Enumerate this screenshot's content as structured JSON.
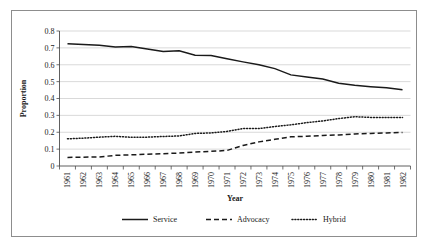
{
  "chart_data": {
    "type": "line",
    "title": "",
    "xlabel": "Year",
    "ylabel": "Proportion",
    "grid": true,
    "legend_position": "bottom",
    "ylim": [
      0,
      0.8
    ],
    "ytick_labels": [
      "0.8",
      "0.7",
      "0.6",
      "0.5",
      "0.4",
      "0.3",
      "0.2",
      "0.1",
      "0"
    ],
    "ytick_values": [
      0.8,
      0.7,
      0.6,
      0.5,
      0.4,
      0.3,
      0.2,
      0.1,
      0
    ],
    "categories": [
      "1961",
      "1962",
      "1963",
      "1964",
      "1965",
      "1966",
      "1967",
      "1968",
      "1969",
      "1970",
      "1971",
      "1972",
      "1973",
      "1974",
      "1975",
      "1976",
      "1977",
      "1978",
      "1979",
      "1980",
      "1981",
      "1982"
    ],
    "x": [
      1961,
      1962,
      1963,
      1964,
      1965,
      1966,
      1967,
      1968,
      1969,
      1970,
      1971,
      1972,
      1973,
      1974,
      1975,
      1976,
      1977,
      1978,
      1979,
      1980,
      1981,
      1982
    ],
    "series": [
      {
        "name": "Service",
        "style": "solid",
        "color": "#1a1a1a",
        "values": [
          0.725,
          0.72,
          0.715,
          0.705,
          0.708,
          0.693,
          0.679,
          0.683,
          0.657,
          0.655,
          0.635,
          0.617,
          0.6,
          0.577,
          0.54,
          0.527,
          0.515,
          0.491,
          0.478,
          0.47,
          0.463,
          0.452
        ]
      },
      {
        "name": "Advocacy",
        "style": "dashed",
        "color": "#1a1a1a",
        "values": [
          0.051,
          0.052,
          0.054,
          0.063,
          0.066,
          0.07,
          0.073,
          0.077,
          0.083,
          0.087,
          0.092,
          0.122,
          0.143,
          0.158,
          0.173,
          0.176,
          0.181,
          0.184,
          0.19,
          0.193,
          0.196,
          0.199
        ]
      },
      {
        "name": "Hybrid",
        "style": "dotted",
        "color": "#1a1a1a",
        "values": [
          0.161,
          0.165,
          0.171,
          0.176,
          0.17,
          0.171,
          0.175,
          0.178,
          0.193,
          0.196,
          0.205,
          0.222,
          0.222,
          0.234,
          0.244,
          0.257,
          0.267,
          0.281,
          0.292,
          0.288,
          0.287,
          0.287
        ]
      }
    ]
  },
  "legend": {
    "items": [
      {
        "label": "Service"
      },
      {
        "label": "Advocacy"
      },
      {
        "label": "Hybrid"
      }
    ]
  }
}
